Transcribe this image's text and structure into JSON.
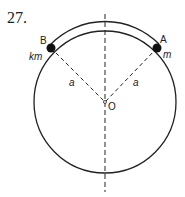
{
  "problem_number": "27.",
  "labels": {
    "point_a": "A",
    "point_b": "B",
    "mass_a": "m",
    "mass_b": "km",
    "radius_left": "a",
    "radius_right": "a",
    "center": "O"
  },
  "colors": {
    "stroke": "#222222",
    "background": "#ffffff"
  }
}
